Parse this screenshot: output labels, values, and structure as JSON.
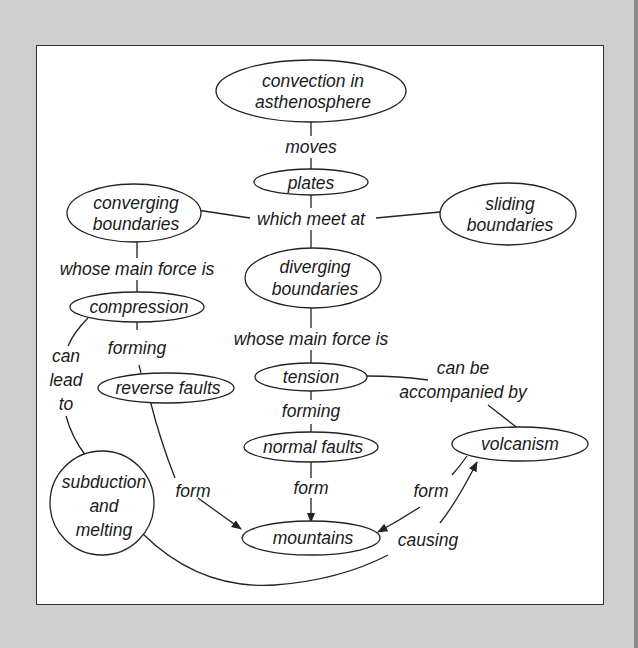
{
  "diagram": {
    "nodes": {
      "convection": {
        "line1": "convection in",
        "line2": "asthenosphere"
      },
      "plates": {
        "label": "plates"
      },
      "converging": {
        "line1": "converging",
        "line2": "boundaries"
      },
      "sliding": {
        "line1": "sliding",
        "line2": "boundaries"
      },
      "diverging": {
        "line1": "diverging",
        "line2": "boundaries"
      },
      "compression": {
        "label": "compression"
      },
      "tension": {
        "label": "tension"
      },
      "reverse_faults": {
        "label": "reverse faults"
      },
      "normal_faults": {
        "label": "normal faults"
      },
      "volcanism": {
        "label": "volcanism"
      },
      "subduction": {
        "line1": "subduction",
        "line2": "and",
        "line3": "melting"
      },
      "mountains": {
        "label": "mountains"
      }
    },
    "links": {
      "moves": "moves",
      "which_meet_at": "which meet at",
      "left_main_force": "whose main force is",
      "center_main_force": "whose main force is",
      "can_lead_to": {
        "line1": "can",
        "line2": "lead",
        "line3": "to"
      },
      "forming_left": "forming",
      "forming_center": "forming",
      "can_be_accompanied": {
        "line1": "can be",
        "line2": "accompanied by"
      },
      "form_left": "form",
      "form_center": "form",
      "form_right": "form",
      "causing": "causing"
    },
    "colors": {
      "background": "#cfcfcf",
      "panel": "#ffffff",
      "stroke": "#222222",
      "text": "#1a1a1a"
    }
  }
}
